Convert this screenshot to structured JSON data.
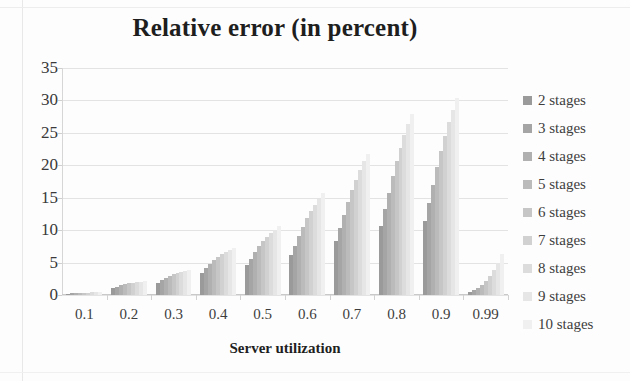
{
  "chart_data": {
    "type": "bar",
    "title": "Relative error (in percent)",
    "xlabel": "Server utilization",
    "ylabel": "",
    "categories": [
      "0.1",
      "0.2",
      "0.3",
      "0.4",
      "0.5",
      "0.6",
      "0.7",
      "0.8",
      "0.9",
      "0.99"
    ],
    "ylim": [
      0,
      35
    ],
    "yticks": [
      0,
      5,
      10,
      15,
      20,
      25,
      30,
      35
    ],
    "grid": true,
    "legend_position": "right",
    "series": [
      {
        "name": "2 stages",
        "color": "#9a9a9a",
        "values": [
          0.2,
          1.1,
          1.9,
          3.4,
          4.6,
          6.2,
          8.3,
          10.6,
          11.4,
          0.4
        ]
      },
      {
        "name": "3 stages",
        "color": "#a5a5a5",
        "values": [
          0.25,
          1.3,
          2.3,
          4.1,
          5.6,
          7.6,
          10.4,
          13.2,
          14.2,
          0.7
        ]
      },
      {
        "name": "4 stages",
        "color": "#b0b0b0",
        "values": [
          0.3,
          1.5,
          2.7,
          4.8,
          6.6,
          9.1,
          12.4,
          15.8,
          17.0,
          1.1
        ]
      },
      {
        "name": "5 stages",
        "color": "#bbbbbb",
        "values": [
          0.3,
          1.7,
          3.0,
          5.4,
          7.5,
          10.5,
          14.4,
          18.3,
          19.7,
          1.6
        ]
      },
      {
        "name": "6 stages",
        "color": "#c6c6c6",
        "values": [
          0.35,
          1.8,
          3.2,
          5.9,
          8.3,
          11.8,
          16.2,
          20.6,
          22.2,
          2.2
        ]
      },
      {
        "name": "7 stages",
        "color": "#d1d1d1",
        "values": [
          0.35,
          1.9,
          3.4,
          6.3,
          9.0,
          12.9,
          17.8,
          22.7,
          24.5,
          2.9
        ]
      },
      {
        "name": "8 stages",
        "color": "#dcdcdc",
        "values": [
          0.4,
          2.0,
          3.6,
          6.7,
          9.6,
          13.9,
          19.3,
          24.6,
          26.6,
          3.8
        ]
      },
      {
        "name": "9 stages",
        "color": "#e6e6e6",
        "values": [
          0.4,
          2.05,
          3.7,
          7.0,
          10.1,
          14.8,
          20.6,
          26.3,
          28.5,
          4.9
        ]
      },
      {
        "name": "10 stages",
        "color": "#f0f0f0",
        "values": [
          0.4,
          2.1,
          3.8,
          7.3,
          10.6,
          15.7,
          21.8,
          27.9,
          30.3,
          6.3
        ]
      }
    ]
  }
}
